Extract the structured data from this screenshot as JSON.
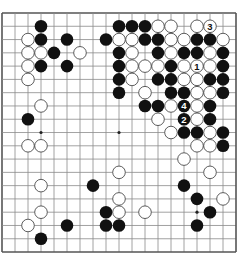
{
  "board": {
    "size": 19,
    "origin_x": 2,
    "origin_y": 13,
    "step_x": 13,
    "step_y": 13.28,
    "line_color": "#8a8a8a",
    "border_color": "#555555",
    "star_points": [
      [
        3,
        9
      ],
      [
        9,
        9
      ],
      [
        15,
        15
      ]
    ],
    "black_stones": [
      [
        3,
        1
      ],
      [
        3,
        2
      ],
      [
        5,
        2
      ],
      [
        8,
        2
      ],
      [
        4,
        3
      ],
      [
        3,
        4
      ],
      [
        5,
        4
      ],
      [
        2,
        8
      ],
      [
        9,
        1
      ],
      [
        10,
        1
      ],
      [
        11,
        1
      ],
      [
        11,
        2
      ],
      [
        12,
        2
      ],
      [
        9,
        3
      ],
      [
        12,
        3
      ],
      [
        9,
        4
      ],
      [
        13,
        4
      ],
      [
        9,
        5
      ],
      [
        12,
        5
      ],
      [
        13,
        5
      ],
      [
        9,
        6
      ],
      [
        13,
        6
      ],
      [
        14,
        6
      ],
      [
        11,
        7
      ],
      [
        12,
        7
      ],
      [
        15,
        2
      ],
      [
        16,
        2
      ],
      [
        14,
        3
      ],
      [
        15,
        3
      ],
      [
        17,
        3
      ],
      [
        17,
        4
      ],
      [
        16,
        5
      ],
      [
        17,
        5
      ],
      [
        17,
        6
      ],
      [
        16,
        7
      ],
      [
        16,
        8
      ],
      [
        14,
        9
      ],
      [
        15,
        9
      ],
      [
        17,
        9
      ],
      [
        17,
        10
      ],
      [
        14,
        13
      ],
      [
        15,
        14
      ],
      [
        16,
        15
      ],
      [
        15,
        16
      ],
      [
        7,
        13
      ],
      [
        8,
        15
      ],
      [
        5,
        16
      ],
      [
        8,
        16
      ],
      [
        9,
        16
      ],
      [
        3,
        17
      ]
    ],
    "white_stones": [
      [
        2,
        2
      ],
      [
        2,
        3
      ],
      [
        3,
        3
      ],
      [
        6,
        3
      ],
      [
        2,
        4
      ],
      [
        2,
        5
      ],
      [
        3,
        7
      ],
      [
        12,
        1
      ],
      [
        13,
        1
      ],
      [
        15,
        1
      ],
      [
        9,
        2
      ],
      [
        10,
        2
      ],
      [
        13,
        2
      ],
      [
        14,
        2
      ],
      [
        17,
        2
      ],
      [
        10,
        3
      ],
      [
        13,
        3
      ],
      [
        16,
        3
      ],
      [
        10,
        4
      ],
      [
        11,
        4
      ],
      [
        12,
        4
      ],
      [
        14,
        4
      ],
      [
        16,
        4
      ],
      [
        10,
        5
      ],
      [
        14,
        5
      ],
      [
        15,
        5
      ],
      [
        11,
        6
      ],
      [
        15,
        6
      ],
      [
        16,
        6
      ],
      [
        13,
        7
      ],
      [
        15,
        7
      ],
      [
        12,
        8
      ],
      [
        15,
        8
      ],
      [
        13,
        9
      ],
      [
        16,
        9
      ],
      [
        15,
        10
      ],
      [
        16,
        10
      ],
      [
        14,
        11
      ],
      [
        16,
        12
      ],
      [
        17,
        14
      ],
      [
        11,
        15
      ],
      [
        2,
        10
      ],
      [
        3,
        10
      ],
      [
        3,
        13
      ],
      [
        3,
        15
      ],
      [
        2,
        16
      ],
      [
        9,
        12
      ],
      [
        9,
        14
      ],
      [
        9,
        15
      ]
    ],
    "numbered_moves": [
      {
        "label": "1",
        "color": "white",
        "col": 15,
        "row": 4
      },
      {
        "label": "2",
        "color": "black",
        "col": 14,
        "row": 8
      },
      {
        "label": "3",
        "color": "white",
        "col": 16,
        "row": 1
      },
      {
        "label": "4",
        "color": "black",
        "col": 14,
        "row": 7
      }
    ]
  }
}
